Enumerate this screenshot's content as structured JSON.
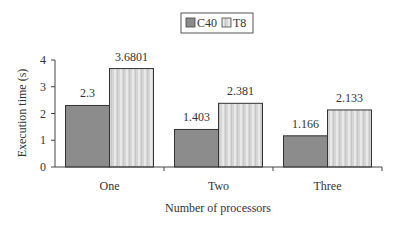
{
  "chart_data": {
    "type": "bar",
    "title": "",
    "xlabel": "Number of processors",
    "ylabel": "Execution time (s)",
    "ylim": [
      0,
      4
    ],
    "yticks": [
      0,
      1,
      2,
      3,
      4
    ],
    "categories": [
      "One",
      "Two",
      "Three"
    ],
    "series": [
      {
        "name": "C40",
        "values": [
          2.3,
          1.403,
          1.166
        ],
        "labels": [
          "2.3",
          "1.403",
          "1.166"
        ],
        "color": "#8c8c8c",
        "pattern": "solid"
      },
      {
        "name": "T8",
        "values": [
          3.6801,
          2.381,
          2.133
        ],
        "labels": [
          "3.6801",
          "2.381",
          "2.133"
        ],
        "color": "#d2d2d2",
        "pattern": "vertical-stripes"
      }
    ],
    "legend_position": "top",
    "grid": false,
    "data_labels": true
  }
}
